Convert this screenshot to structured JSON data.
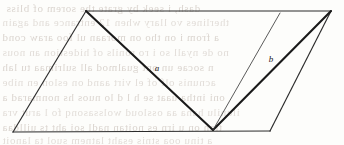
{
  "figure": {
    "kind": "geometry-diagram",
    "shape_name": "parallelogram",
    "width": 344,
    "height": 145,
    "background_color": "#fdfdfb",
    "ink_color": "#1a1a1a",
    "bleed_color": "#b9ada4"
  },
  "labels": {
    "segment_a": "a",
    "segment_b": "b"
  },
  "chart_data": {
    "type": "diagram",
    "title": "",
    "xlabel": "",
    "ylabel": "",
    "xlim": [
      0,
      344
    ],
    "ylim": [
      0,
      145
    ],
    "grid": false,
    "legend": "none",
    "vertices": [
      {
        "id": "A",
        "x": 86,
        "y": 11,
        "role": "parallelogram-top-left"
      },
      {
        "id": "B",
        "x": 331,
        "y": 11,
        "role": "parallelogram-top-right"
      },
      {
        "id": "C",
        "x": 270,
        "y": 131,
        "role": "parallelogram-bottom-right"
      },
      {
        "id": "D",
        "x": 13,
        "y": 132,
        "role": "parallelogram-bottom-left"
      },
      {
        "id": "E",
        "x": 213,
        "y": 130,
        "role": "interior-apex-on-base"
      },
      {
        "id": "F",
        "x": 280,
        "y": 13,
        "role": "point-on-top-edge"
      }
    ],
    "outline": [
      {
        "name": "top-edge",
        "from": "A",
        "to": "B",
        "weight": "thin"
      },
      {
        "name": "right-edge",
        "from": "B",
        "to": "C",
        "weight": "thin"
      },
      {
        "name": "bottom-edge",
        "from": "C",
        "to": "D",
        "weight": "thin"
      },
      {
        "name": "left-edge",
        "from": "D",
        "to": "A",
        "weight": "thin"
      }
    ],
    "interior_segments": [
      {
        "name": "segment-a",
        "from": "A",
        "to": "E",
        "weight": "heavy",
        "label": "a",
        "label_x": 157,
        "label_y": 69
      },
      {
        "name": "segment-b",
        "from": "E",
        "to": "B",
        "weight": "heavy",
        "label": "b",
        "label_x": 271,
        "label_y": 60
      },
      {
        "name": "segment-ef",
        "from": "E",
        "to": "F",
        "weight": "thin",
        "label": "",
        "label_x": 0,
        "label_y": 0
      }
    ]
  },
  "bleed_text": {
    "note": "faint mirrored show-through text from reverse page side",
    "lines": [
      {
        "text": "dash, i seek by grate the sorem of bliss",
        "x": 6,
        "y": 2,
        "size": 11
      },
      {
        "text": "therlines  vo llary when 12 entrance and again",
        "x": 2,
        "y": 16,
        "size": 11
      },
      {
        "text": "a from  i on  tho on  moraan ul foo  araw  cond",
        "x": 2,
        "y": 31,
        "size": 11
      },
      {
        "text": "no de nyall so  i  ro  ronils of hidestion an  nous",
        "x": 2,
        "y": 46,
        "size": 11
      },
      {
        "text": "n  socae  un  ont  gualmod all sulrimaa  tu  lah",
        "x": 2,
        "y": 61,
        "size": 11
      },
      {
        "text": "acnunis  olf  of  el  virt  aand  on  eslon  en  nibe",
        "x": 2,
        "y": 76,
        "size": 11
      },
      {
        "text": "oni  intha  uaat  se  h l d   lo  nuos  hs  nonmarad  a",
        "x": 2,
        "y": 91,
        "size": 11
      },
      {
        "text": "ilunilu  hana  aa  ossloud  wolssasonq  fo  l arut  vra",
        "x": 2,
        "y": 106,
        "size": 11
      },
      {
        "text": "tlan on u  irn  es  noitan  nadl soi  aht  ts  uilldaa",
        "x": 2,
        "y": 121,
        "size": 11
      },
      {
        "text": "a  tinu  ooa  stnis  esaht  latnem  suol  ta  lanoit",
        "x": 2,
        "y": 134,
        "size": 11
      }
    ]
  }
}
